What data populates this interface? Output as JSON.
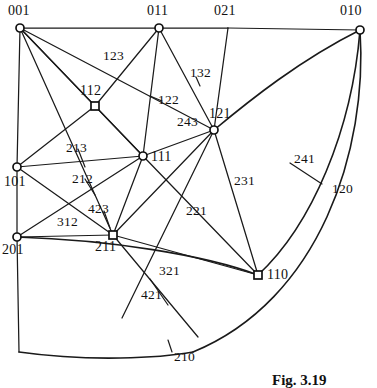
{
  "figure": {
    "caption": "Fig. 3.19",
    "caption_x": 272,
    "caption_y": 372,
    "width": 377,
    "height": 388,
    "background": "#ffffff",
    "ink_color": "#1a1a1a"
  },
  "nodes": [
    {
      "id": "001",
      "label": "001",
      "x": 20,
      "y": 28,
      "marker": "circle",
      "label_x": 8,
      "label_y": 4
    },
    {
      "id": "011",
      "label": "011",
      "x": 159,
      "y": 28,
      "marker": "circle",
      "label_x": 147,
      "label_y": 4
    },
    {
      "id": "021",
      "label": "021",
      "x": 228,
      "y": 28,
      "marker": "none",
      "label_x": 214,
      "label_y": 4
    },
    {
      "id": "010",
      "label": "010",
      "x": 360,
      "y": 30,
      "marker": "circle",
      "label_x": 340,
      "label_y": 4
    },
    {
      "id": "112",
      "label": "112",
      "x": 95,
      "y": 106,
      "marker": "square",
      "label_x": 80,
      "label_y": 84
    },
    {
      "id": "121",
      "label": "121",
      "x": 214,
      "y": 130,
      "marker": "circle",
      "label_x": 209,
      "label_y": 107
    },
    {
      "id": "111",
      "label": "111",
      "x": 143,
      "y": 156,
      "marker": "circle",
      "label_x": 151,
      "label_y": 150
    },
    {
      "id": "101",
      "label": "101",
      "x": 17,
      "y": 167,
      "marker": "circle",
      "label_x": 4,
      "label_y": 175
    },
    {
      "id": "201",
      "label": "201",
      "x": 17,
      "y": 237,
      "marker": "circle",
      "label_x": 2,
      "label_y": 243
    },
    {
      "id": "211",
      "label": "211",
      "x": 113,
      "y": 235,
      "marker": "square",
      "label_x": 95,
      "label_y": 240
    },
    {
      "id": "110",
      "label": "110",
      "x": 258,
      "y": 275,
      "marker": "square",
      "label_x": 267,
      "label_y": 268
    }
  ],
  "edge_labels": [
    {
      "text": "123",
      "x": 103,
      "y": 49
    },
    {
      "text": "132",
      "x": 190,
      "y": 66
    },
    {
      "text": "122",
      "x": 158,
      "y": 93
    },
    {
      "text": "243",
      "x": 177,
      "y": 115
    },
    {
      "text": "213",
      "x": 66,
      "y": 141
    },
    {
      "text": "241",
      "x": 294,
      "y": 152
    },
    {
      "text": "212",
      "x": 72,
      "y": 172
    },
    {
      "text": "231",
      "x": 234,
      "y": 174
    },
    {
      "text": "120",
      "x": 332,
      "y": 182
    },
    {
      "text": "423",
      "x": 88,
      "y": 202
    },
    {
      "text": "312",
      "x": 57,
      "y": 215
    },
    {
      "text": "221",
      "x": 186,
      "y": 204
    },
    {
      "text": "321",
      "x": 159,
      "y": 264
    },
    {
      "text": "421",
      "x": 141,
      "y": 288
    },
    {
      "text": "210",
      "x": 174,
      "y": 350
    }
  ],
  "edges": [
    {
      "from": "001",
      "to": "011",
      "kind": "line"
    },
    {
      "from": "011",
      "to": "021",
      "kind": "line"
    },
    {
      "from": "021",
      "to": "010",
      "kind": "line"
    },
    {
      "from": "001",
      "to": "101",
      "kind": "line"
    },
    {
      "from": "101",
      "to": "201",
      "kind": "line"
    },
    {
      "from": "001",
      "to": "112",
      "kind": "line"
    },
    {
      "from": "001",
      "to": "111",
      "kind": "line"
    },
    {
      "from": "001",
      "to": "121",
      "kind": "line"
    },
    {
      "from": "001",
      "to": "211",
      "kind": "line"
    },
    {
      "from": "011",
      "to": "112",
      "kind": "line"
    },
    {
      "from": "011",
      "to": "111",
      "kind": "line"
    },
    {
      "from": "011",
      "to": "121",
      "kind": "line"
    },
    {
      "from": "021",
      "to": "121",
      "kind": "line"
    },
    {
      "from": "112",
      "to": "111",
      "kind": "line"
    },
    {
      "from": "112",
      "to": "101",
      "kind": "line"
    },
    {
      "from": "111",
      "to": "101",
      "kind": "line"
    },
    {
      "from": "111",
      "to": "121",
      "kind": "line"
    },
    {
      "from": "111",
      "to": "211",
      "kind": "line"
    },
    {
      "from": "111",
      "to": "110",
      "kind": "line"
    },
    {
      "from": "121",
      "to": "211",
      "kind": "line"
    },
    {
      "from": "121",
      "to": "110",
      "kind": "line"
    },
    {
      "from": "101",
      "to": "211",
      "kind": "line"
    },
    {
      "from": "201",
      "to": "211",
      "kind": "line"
    },
    {
      "from": "211",
      "to": "110",
      "kind": "line"
    },
    {
      "from": "010",
      "to": "121",
      "kind": "curve"
    },
    {
      "from": "010",
      "to": "110",
      "kind": "curve"
    },
    {
      "from": "010",
      "to": "211",
      "kind": "curve"
    },
    {
      "from": "201",
      "to": "110",
      "kind": "curve"
    }
  ]
}
